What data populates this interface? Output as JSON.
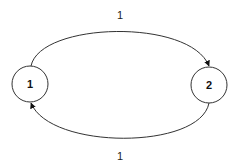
{
  "diagram": {
    "type": "directed-graph",
    "nodes": [
      {
        "id": "n1",
        "label": "1"
      },
      {
        "id": "n2",
        "label": "2"
      }
    ],
    "edges": [
      {
        "from": "1",
        "to": "2",
        "label": "1",
        "position": "top"
      },
      {
        "from": "2",
        "to": "1",
        "label": "1",
        "position": "bottom"
      }
    ]
  }
}
